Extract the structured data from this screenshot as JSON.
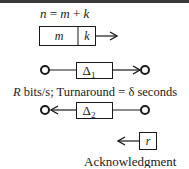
{
  "diagram": {
    "formula": {
      "n": "n",
      "eq": " = ",
      "m": "m",
      "plus": " + ",
      "k": "k"
    },
    "frame": {
      "m_label": "m",
      "k_label": "k"
    },
    "forward_channel": {
      "delay_symbol": "Δ",
      "delay_subscript": "1"
    },
    "rate_text": {
      "R": "R",
      "rest": " bits/s; Turnaround = δ seconds"
    },
    "reverse_channel": {
      "delay_symbol": "Δ",
      "delay_subscript": "2"
    },
    "ack": {
      "box_label": "r",
      "caption": "Acknowledgment"
    },
    "colors": {
      "ink": "#1a1a1a",
      "border": "#3a3a3a",
      "background": "#ffffff"
    }
  }
}
